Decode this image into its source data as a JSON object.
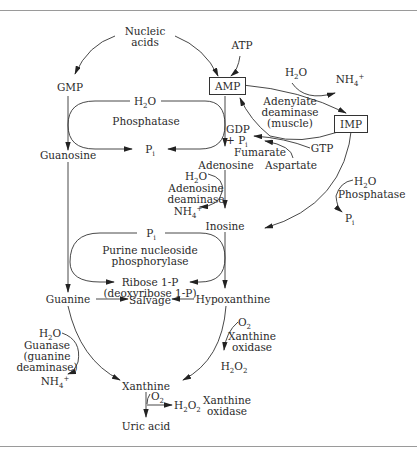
{
  "diagram": {
    "type": "metabolic-pathway",
    "nodes": {
      "nucleic_acids": "Nucleic\nacids",
      "atp": "ATP",
      "gmp": "GMP",
      "amp": "AMP",
      "imp": "IMP",
      "guanosine": "Guanosine",
      "adenosine": "Adenosine",
      "inosine": "Inosine",
      "guanine": "Guanine",
      "hypoxanthine": "Hypoxanthine",
      "salvage": "Salvage",
      "xanthine": "Xanthine",
      "uric_acid": "Uric acid"
    },
    "enzymes": {
      "phosphatase_top": "Phosphatase",
      "adenylate_deaminase": [
        "Adenylate",
        "deaminase",
        "(muscle)"
      ],
      "adenosine_deaminase": [
        "Adenosine",
        "deaminase"
      ],
      "phosphatase_right": "Phosphatase",
      "pnp": [
        "Purine nucleoside",
        "phosphorylase"
      ],
      "guanase": [
        "Guanase",
        "(guanine",
        "deaminase)"
      ],
      "xanthine_oxidase_1": [
        "Xanthine",
        "oxidase"
      ],
      "xanthine_oxidase_2": [
        "Xanthine",
        "oxidase"
      ]
    },
    "cofactors": {
      "h2o": "H₂O",
      "nh4": "NH₄⁺",
      "pi": "Pᵢ",
      "gdp_pi": [
        "GDP",
        "+ Pᵢ"
      ],
      "fumarate": "Fumarate",
      "aspartate": "Aspartate",
      "gtp": "GTP",
      "ribose": [
        "Ribose 1-P",
        "(deoxyribose 1-P)"
      ],
      "o2": "O₂",
      "h2o2": "H₂O₂"
    }
  }
}
